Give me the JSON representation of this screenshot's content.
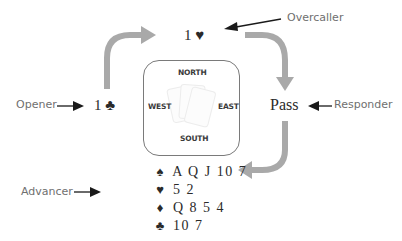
{
  "diagram": {
    "roles": {
      "overcaller": "Overcaller",
      "opener": "Opener",
      "responder": "Responder",
      "advancer": "Advancer"
    },
    "bids": {
      "overcaller_bid": "1 ♥",
      "opener_bid": "1 ♣",
      "responder_bid": "Pass"
    },
    "table": {
      "north": "NORTH",
      "south": "SOUTH",
      "east": "EAST",
      "west": "WEST"
    },
    "advancer_hand": [
      {
        "suit": "♠",
        "cards": "A Q J 10 7"
      },
      {
        "suit": "♥",
        "cards": "5 2"
      },
      {
        "suit": "♦",
        "cards": "Q 8 5 4"
      },
      {
        "suit": "♣",
        "cards": "10 7"
      }
    ],
    "colors": {
      "flow_arrow": "#a9a9a9",
      "pointer_arrow": "#1a1a1a",
      "label_text": "#6f6f6f",
      "bid_text": "#2a2a2a",
      "table_border": "#7a7a7a"
    }
  }
}
